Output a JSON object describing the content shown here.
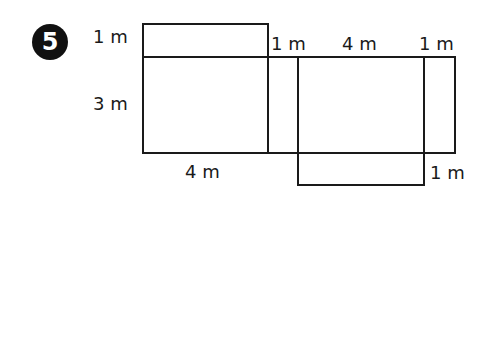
{
  "problem": {
    "number": "5"
  },
  "net": {
    "faces": [
      {
        "name": "top-flap",
        "width": "4 m",
        "height": "1 m"
      },
      {
        "name": "front-face",
        "width": "4 m",
        "height": "3 m"
      },
      {
        "name": "side-face-left",
        "width": "1 m",
        "height": "3 m"
      },
      {
        "name": "back-face",
        "width": "4 m",
        "height": "3 m"
      },
      {
        "name": "side-face-right",
        "width": "1 m",
        "height": "3 m"
      },
      {
        "name": "bottom-flap",
        "width": "4 m",
        "height": "1 m"
      }
    ]
  },
  "labels": {
    "top_flap_height": "1 m",
    "front_height": "3 m",
    "front_width": "4 m",
    "left_side_width": "1 m",
    "back_width": "4 m",
    "right_side_width": "1 m",
    "bottom_flap_height": "1 m"
  }
}
